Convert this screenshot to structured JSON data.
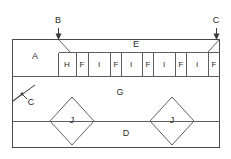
{
  "figure": {
    "line_color": "#5f5f5f",
    "outline_color": "#4a4a4a",
    "text_color": "#2b2b2b",
    "background": "#ffffff"
  },
  "callouts": [
    {
      "id": "callout-b-top",
      "label": "B",
      "x": 58,
      "y": 22,
      "arrow": "down"
    },
    {
      "id": "callout-c-top",
      "label": "C",
      "x": 216,
      "y": 22,
      "arrow": "down"
    },
    {
      "id": "callout-c-left",
      "label": "C",
      "x": 31,
      "y": 101,
      "arrow": "leader"
    }
  ],
  "regions": [
    {
      "id": "region-a",
      "label": "A",
      "x": 35,
      "y": 57
    },
    {
      "id": "region-e",
      "label": "E",
      "x": 136,
      "y": 45
    },
    {
      "id": "region-g",
      "label": "G",
      "x": 120,
      "y": 93
    },
    {
      "id": "region-d",
      "label": "D",
      "x": 126,
      "y": 134
    }
  ],
  "diamonds": [
    {
      "id": "diamond-left",
      "label": "J",
      "cx": 72,
      "cy": 121,
      "rx": 22,
      "ry": 24
    },
    {
      "id": "diamond-right",
      "label": "J",
      "cx": 172,
      "cy": 121,
      "rx": 22,
      "ry": 24
    }
  ],
  "strip": {
    "id": "top-strip",
    "y_top": 52,
    "y_bottom": 76,
    "x_start": 58,
    "x_end": 220,
    "cells": [
      {
        "label": "H",
        "x0": 58,
        "x1": 76
      },
      {
        "label": "F",
        "x0": 76,
        "x1": 88
      },
      {
        "label": "I",
        "x0": 88,
        "x1": 110
      },
      {
        "label": "F",
        "x0": 110,
        "x1": 121
      },
      {
        "label": "I",
        "x0": 121,
        "x1": 142
      },
      {
        "label": "F",
        "x0": 142,
        "x1": 153
      },
      {
        "label": "I",
        "x0": 153,
        "x1": 175
      },
      {
        "label": "F",
        "x0": 175,
        "x1": 186
      },
      {
        "label": "I",
        "x0": 186,
        "x1": 208
      },
      {
        "label": "F",
        "x0": 208,
        "x1": 220
      }
    ]
  },
  "frame": {
    "x": 12,
    "y": 39,
    "width": 208,
    "height": 109,
    "divider_upper_y": 76,
    "divider_lower_y": 121
  }
}
